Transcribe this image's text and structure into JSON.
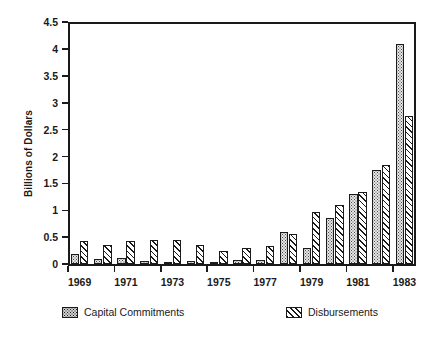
{
  "chart_data": {
    "type": "bar",
    "title": "",
    "xlabel": "",
    "ylabel": "Billions of Dollars",
    "ylim": [
      0,
      4.5
    ],
    "yticks": [
      0,
      0.5,
      1,
      1.5,
      2,
      2.5,
      3,
      3.5,
      4,
      4.5
    ],
    "ytick_labels": [
      "0",
      "0.5",
      "1",
      "1.5",
      "2",
      "2.5",
      "3",
      "3.5",
      "4",
      "4.5"
    ],
    "grid": false,
    "legend_position": "bottom",
    "categories": [
      "1969",
      "1970",
      "1971",
      "1972",
      "1973",
      "1974",
      "1975",
      "1976",
      "1977",
      "1978",
      "1979",
      "1980",
      "1981",
      "1982",
      "1983"
    ],
    "xtick_labels": [
      "1969",
      "1971",
      "1973",
      "1975",
      "1977",
      "1979",
      "1981",
      "1983"
    ],
    "series": [
      {
        "name": "Capital Commitments",
        "pattern": "dotted",
        "values": [
          0.19,
          0.1,
          0.11,
          0.06,
          0.05,
          0.06,
          0.04,
          0.07,
          0.08,
          0.6,
          0.3,
          0.85,
          1.3,
          1.75,
          4.1
        ]
      },
      {
        "name": "Disbursements",
        "pattern": "diagonal-hatch",
        "values": [
          0.43,
          0.36,
          0.43,
          0.45,
          0.45,
          0.35,
          0.25,
          0.3,
          0.33,
          0.57,
          0.97,
          1.1,
          1.35,
          1.85,
          2.75
        ]
      }
    ]
  },
  "legend": {
    "entries": [
      {
        "label": "Capital Commitments"
      },
      {
        "label": "Disbursements"
      }
    ]
  },
  "caption": ""
}
